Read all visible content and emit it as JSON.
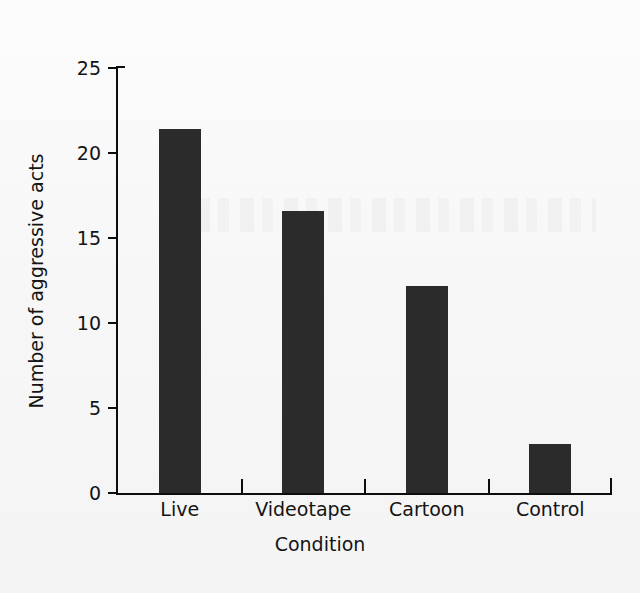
{
  "chart_data": {
    "type": "bar",
    "title": "",
    "categories": [
      "Live",
      "Videotape",
      "Cartoon",
      "Control"
    ],
    "values": [
      21.4,
      16.6,
      12.2,
      2.9
    ],
    "xlabel": "Condition",
    "ylabel": "Number of aggressive acts",
    "ylim": [
      0,
      25
    ],
    "yticks": [
      "0",
      "5",
      "10",
      "15",
      "20",
      "25"
    ],
    "ytick_values": [
      0,
      5,
      10,
      15,
      20,
      25
    ],
    "grid": false,
    "legend": null,
    "bar_color": "#2b2b2b",
    "axis_color": "#0d0d0d",
    "background_color": "#fbfbfb"
  }
}
